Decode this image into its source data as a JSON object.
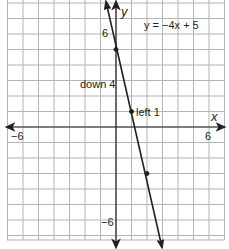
{
  "chart_data": {
    "type": "line",
    "title": "",
    "equation": "y = −4x + 5",
    "xlabel": "x",
    "ylabel": "y",
    "xlim": [
      -7,
      7
    ],
    "ylim": [
      -7.3,
      8.2
    ],
    "grid": true,
    "grid_step": 1,
    "x_ticks_labeled": [
      {
        "value": -6,
        "label": "−6"
      },
      {
        "value": 6,
        "label": "6"
      }
    ],
    "y_ticks_labeled": [
      {
        "value": 6,
        "label": "6"
      },
      {
        "value": -6,
        "label": "−6"
      }
    ],
    "series": [
      {
        "name": "y = −4x + 5",
        "slope": -4,
        "intercept": 5,
        "x": [
          -0.7,
          2.9
        ],
        "y": [
          7.8,
          -6.6
        ]
      }
    ],
    "points": [
      {
        "x": 0,
        "y": 5
      },
      {
        "x": 1,
        "y": 1
      },
      {
        "x": 2,
        "y": -3
      }
    ],
    "annotations": [
      {
        "text": "down 4",
        "x": -1.6,
        "y": 3
      },
      {
        "text": "left 1",
        "x": 1.25,
        "y": 1
      }
    ]
  },
  "labels": {
    "equation": "y = −4x + 5",
    "x_axis": "x",
    "y_axis": "y",
    "x_neg6": "−6",
    "x_pos6": "6",
    "y_pos6": "6",
    "y_neg6": "−6",
    "down": "down 4",
    "left": "left 1"
  },
  "colors": {
    "grid": "#b5b5b5",
    "axis": "#231f20",
    "line": "#231f20",
    "text": "#231f20"
  }
}
